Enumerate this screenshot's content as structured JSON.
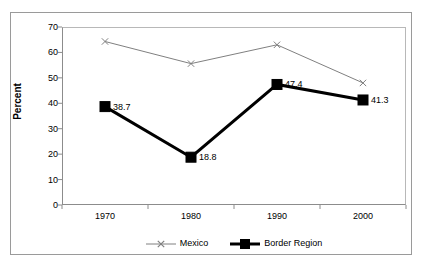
{
  "chart_data": {
    "type": "line",
    "title": "",
    "xlabel": "",
    "ylabel": "Percent",
    "categories": [
      "1970",
      "1980",
      "1990",
      "2000"
    ],
    "ylim": [
      0,
      70
    ],
    "yticks": [
      70,
      60,
      50,
      40,
      30,
      20,
      10,
      0
    ],
    "grid": false,
    "legend_position": "bottom-center",
    "series": [
      {
        "name": "Mexico",
        "values": [
          64.3,
          55.6,
          63.0,
          48.0
        ],
        "labels": [
          "",
          "",
          "",
          ""
        ],
        "color": "#808080",
        "marker": "x",
        "line_width": 1
      },
      {
        "name": "Border Region",
        "values": [
          38.7,
          18.8,
          47.4,
          41.3
        ],
        "labels": [
          "38.7",
          "18.8",
          "47.4",
          "41.3"
        ],
        "color": "#000000",
        "marker": "square",
        "line_width": 3
      }
    ]
  },
  "legend": {
    "items": [
      {
        "label": "Mexico",
        "marker": "x-marker-icon"
      },
      {
        "label": "Border Region",
        "marker": "square-marker-icon"
      }
    ]
  }
}
